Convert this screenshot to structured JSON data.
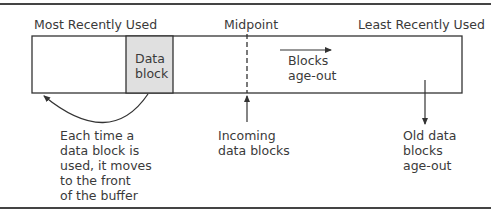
{
  "diagram": {
    "labels": {
      "most_recent": "Most Recently Used",
      "midpoint": "Midpoint",
      "least_recent": "Least Recently Used",
      "data_block": "Data\nblock",
      "blocks_age_out": "Blocks\nage-out",
      "each_time": "Each time a\ndata block is\nused, it moves\nto the front\nof the buffer",
      "incoming": "Incoming\ndata blocks",
      "old_data": "Old data\nblocks\nage-out"
    },
    "colors": {
      "stroke": "#333333",
      "data_block_fill": "#e0e0e0",
      "text": "#3a3a3a"
    }
  }
}
